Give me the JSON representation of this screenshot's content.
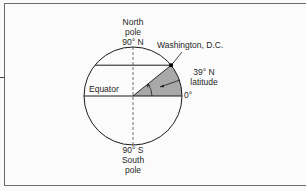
{
  "diagram": {
    "type": "latitude-illustration",
    "north_pole": {
      "line1": "North",
      "line2": "pole",
      "line3": "90° N"
    },
    "south_pole": {
      "line1": "90° S",
      "line2": "South",
      "line3": "pole"
    },
    "equator_label": "Equator",
    "city_label": "Washington, D.C.",
    "latitude_label": {
      "line1": "39° N",
      "line2": "latitude"
    },
    "zero_label": "0°",
    "latitude_degrees": 39,
    "colors": {
      "wedge_fill": "#a9a9a9",
      "stroke": "#1a1a1a",
      "frame": "#6b6b6b",
      "background": "#fbfbfb"
    }
  }
}
